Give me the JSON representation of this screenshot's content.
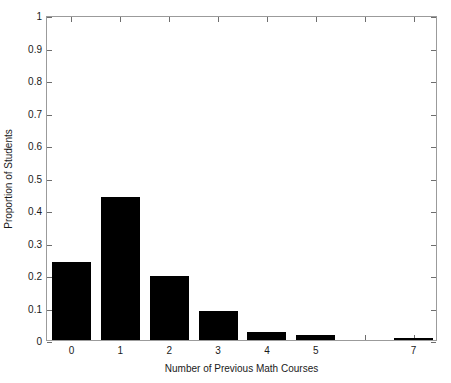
{
  "chart_data": {
    "type": "bar",
    "title": "",
    "subtitle": "",
    "xlabel": "Number of Previous Math Courses",
    "ylabel": "Proportion of Students",
    "categories": [
      "0",
      "1",
      "2",
      "3",
      "4",
      "5",
      "7"
    ],
    "values": [
      0.24,
      0.44,
      0.197,
      0.09,
      0.025,
      0.015,
      0.006
    ],
    "series": [
      {
        "name": "Proportion of Students",
        "values": [
          0.24,
          0.44,
          0.197,
          0.09,
          0.025,
          0.015,
          0.006
        ]
      }
    ],
    "ylim": [
      0,
      1
    ],
    "xlim": [
      -0.5,
      7.5
    ],
    "ytick_values": [
      0,
      0.1,
      0.2,
      0.3,
      0.4,
      0.5,
      0.6,
      0.7,
      0.8,
      0.9,
      1
    ],
    "ytick_labels": [
      "0",
      "0.1",
      "0.2",
      "0.3",
      "0.4",
      "0.5",
      "0.6",
      "0.7",
      "0.8",
      "0.9",
      "1"
    ],
    "xtick_values": [
      0,
      1,
      2,
      3,
      4,
      5,
      7
    ],
    "xtick_labels": [
      "0",
      "1",
      "2",
      "3",
      "4",
      "5",
      "7"
    ],
    "grid": false,
    "legend": null,
    "legend_position": "none",
    "bar_color": "#000000",
    "axis_color": "#9b9b9b",
    "background_color": "#ffffff",
    "annotations": []
  }
}
